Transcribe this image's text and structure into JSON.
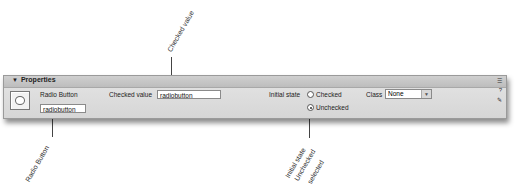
{
  "panel": {
    "title": "Properties",
    "element_type_label": "Radio Button",
    "element_name_value": "radiobutton",
    "checked_value_label": "Checked value",
    "checked_value_value": "radiobutton",
    "initial_state_label": "Initial state",
    "initial_state_options": [
      {
        "label": "Checked",
        "selected": false
      },
      {
        "label": "Unchecked",
        "selected": true
      }
    ],
    "class_label": "Class",
    "class_value": "None",
    "side_icons": [
      "expand-icon",
      "help-icon",
      "edit-icon"
    ]
  },
  "callouts": {
    "checked_value": "Checked value",
    "radio_button": "Radio Button",
    "initial_state_line1": "Initial state",
    "initial_state_line2": "Unchecked",
    "initial_state_line3": "selected"
  }
}
